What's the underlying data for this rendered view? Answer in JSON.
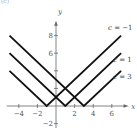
{
  "panel_label": "(c)",
  "axes": {
    "x_label": "x",
    "y_label": "y",
    "x_ticks": [
      {
        "value": -4,
        "label": "−4"
      },
      {
        "value": -2,
        "label": "−2"
      },
      {
        "value": 2,
        "label": "2"
      },
      {
        "value": 4,
        "label": "4"
      },
      {
        "value": 6,
        "label": "6"
      }
    ],
    "y_ticks": [
      {
        "value": -2,
        "label": "−2"
      },
      {
        "value": 2,
        "label": ""
      },
      {
        "value": 4,
        "label": ""
      },
      {
        "value": 6,
        "label": "6"
      },
      {
        "value": 8,
        "label": "8"
      }
    ],
    "xlim": [
      -5,
      7.8
    ],
    "ylim": [
      -2.5,
      9.8
    ]
  },
  "curves": [
    {
      "name": "c = −1",
      "var": "c",
      "rest": " = −1",
      "c": -1
    },
    {
      "name": "c = 1",
      "var": "c",
      "rest": " = 1",
      "c": 1
    },
    {
      "name": "c = 3",
      "var": "c",
      "rest": " = 3",
      "c": 3
    }
  ],
  "chart_data": {
    "type": "line",
    "title": "",
    "function": "y = |x − c|",
    "xlabel": "x",
    "ylabel": "y",
    "xlim": [
      -5,
      7
    ],
    "ylim": [
      -2,
      8
    ],
    "grid": false,
    "series": [
      {
        "name": "c = −1",
        "x": [
          -5,
          -1,
          7
        ],
        "y": [
          4,
          0,
          8
        ]
      },
      {
        "name": "c = 1",
        "x": [
          -5,
          1,
          7
        ],
        "y": [
          6,
          0,
          6
        ]
      },
      {
        "name": "c = 3",
        "x": [
          -5,
          3,
          7
        ],
        "y": [
          8,
          0,
          4
        ]
      }
    ],
    "annotations": [
      {
        "text": "c = −1",
        "near": [
          7,
          8
        ]
      },
      {
        "text": "c = 1",
        "near": [
          7,
          6
        ]
      },
      {
        "text": "c = 3",
        "near": [
          7,
          4
        ]
      }
    ]
  }
}
